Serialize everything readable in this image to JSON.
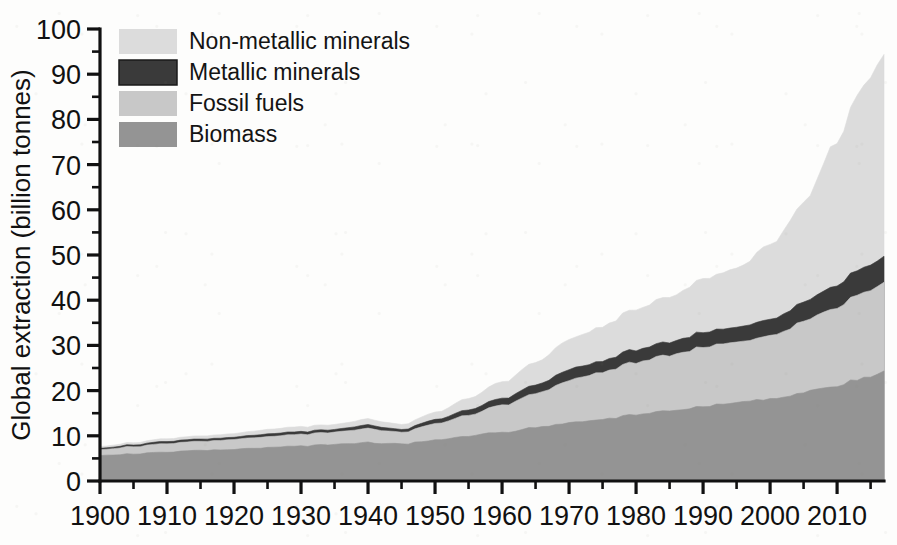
{
  "chart_data": {
    "type": "area",
    "stacked": true,
    "title": "",
    "xlabel": "",
    "ylabel": "Global extraction (billion tonnes)",
    "xlim": [
      1900,
      2017
    ],
    "ylim": [
      0,
      100
    ],
    "grid": false,
    "legend_position": "top-left",
    "xticks": [
      1900,
      1910,
      1920,
      1930,
      1940,
      1950,
      1960,
      1970,
      1980,
      1990,
      2000,
      2010
    ],
    "xtick_labels": [
      "1900",
      "1910",
      "1920",
      "1930",
      "1940",
      "1950",
      "1960",
      "1970",
      "1980",
      "1990",
      "2000",
      "2010"
    ],
    "xminor_step": 5,
    "yticks": [
      0,
      10,
      20,
      30,
      40,
      50,
      60,
      70,
      80,
      90,
      100
    ],
    "ytick_labels": [
      "0",
      "10",
      "20",
      "30",
      "40",
      "50",
      "60",
      "70",
      "80",
      "90",
      "100"
    ],
    "yminor_step": 5,
    "x": [
      1900,
      1905,
      1910,
      1915,
      1920,
      1925,
      1930,
      1935,
      1940,
      1945,
      1950,
      1955,
      1960,
      1965,
      1970,
      1975,
      1980,
      1985,
      1990,
      1995,
      2000,
      2005,
      2010,
      2013,
      2015,
      2017
    ],
    "series": [
      {
        "name": "Biomass",
        "color": "#949494",
        "values": [
          5.6,
          6.0,
          6.4,
          6.7,
          7.0,
          7.4,
          7.7,
          8.1,
          8.5,
          8.2,
          9.1,
          10.0,
          10.8,
          11.8,
          12.8,
          13.6,
          14.6,
          15.5,
          16.5,
          17.2,
          18.2,
          19.6,
          21.2,
          22.4,
          23.3,
          24.2
        ]
      },
      {
        "name": "Fossil fuels",
        "color": "#c8c8c8",
        "values": [
          1.3,
          1.6,
          1.9,
          2.0,
          2.2,
          2.4,
          2.6,
          2.7,
          3.1,
          2.6,
          3.6,
          4.6,
          6.0,
          7.5,
          9.4,
          10.4,
          11.6,
          12.2,
          13.2,
          13.2,
          14.1,
          15.6,
          17.5,
          18.6,
          19.1,
          19.4
        ]
      },
      {
        "name": "Metallic minerals",
        "color": "#3a3a3a",
        "values": [
          0.3,
          0.4,
          0.5,
          0.5,
          0.5,
          0.6,
          0.6,
          0.6,
          0.8,
          0.6,
          0.9,
          1.2,
          1.5,
          1.9,
          2.4,
          2.5,
          2.8,
          2.9,
          3.3,
          3.3,
          3.6,
          4.2,
          4.9,
          5.4,
          5.6,
          5.8
        ]
      },
      {
        "name": "Non-metallic minerals",
        "color": "#dcdcdc",
        "values": [
          0.4,
          0.5,
          0.6,
          0.7,
          0.8,
          1.0,
          1.1,
          1.1,
          1.3,
          1.1,
          1.6,
          2.5,
          3.6,
          5.0,
          6.6,
          7.6,
          9.0,
          10.0,
          11.8,
          13.0,
          16.5,
          22.0,
          32.0,
          39.0,
          42.0,
          44.2
        ]
      }
    ],
    "legend": [
      {
        "label": "Non-metallic minerals",
        "color": "#dcdcdc"
      },
      {
        "label": "Metallic minerals",
        "color": "#3a3a3a"
      },
      {
        "label": "Fossil fuels",
        "color": "#c8c8c8"
      },
      {
        "label": "Biomass",
        "color": "#949494"
      }
    ],
    "stack_order_bottom_to_top": [
      "Biomass",
      "Fossil fuels",
      "Metallic minerals",
      "Non-metallic minerals"
    ],
    "totals_note": ""
  },
  "axes": {
    "plot_left_px": 100,
    "plot_right_px": 884,
    "plot_top_px": 29,
    "plot_bottom_px": 481
  }
}
